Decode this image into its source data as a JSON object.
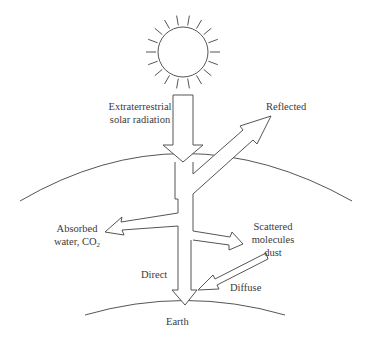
{
  "diagram": {
    "type": "solar-radiation-flow",
    "colors": {
      "stroke": "#555555",
      "text": "#3a3a3a",
      "background": "#ffffff"
    },
    "nodes": {
      "sun": {
        "label": ""
      },
      "atmosphere": {
        "label": ""
      },
      "earth": {
        "label": "Earth"
      }
    },
    "labels": {
      "extraterrestrial_line1": "Extraterrestrial",
      "extraterrestrial_line2": "solar radiation",
      "reflected": "Reflected",
      "absorbed_line1": "Absorbed",
      "absorbed_line2_prefix": "water, CO",
      "absorbed_line2_sub": "2",
      "scattered_line1": "Scattered",
      "scattered_line2": "molecules",
      "scattered_line3": "dust",
      "direct": "Direct",
      "diffuse": "Diffuse",
      "earth": "Earth"
    },
    "edges": [
      {
        "from": "sun",
        "to": "atmosphere",
        "label": "Extraterrestrial solar radiation"
      },
      {
        "from": "atmosphere",
        "to": "space",
        "label": "Reflected"
      },
      {
        "from": "atmosphere",
        "to": "absorption",
        "label": "Absorbed water, CO2"
      },
      {
        "from": "atmosphere",
        "to": "scattering",
        "label": "Scattered molecules dust"
      },
      {
        "from": "atmosphere",
        "to": "earth",
        "label": "Direct"
      },
      {
        "from": "scattering",
        "to": "earth",
        "label": "Diffuse"
      }
    ]
  }
}
